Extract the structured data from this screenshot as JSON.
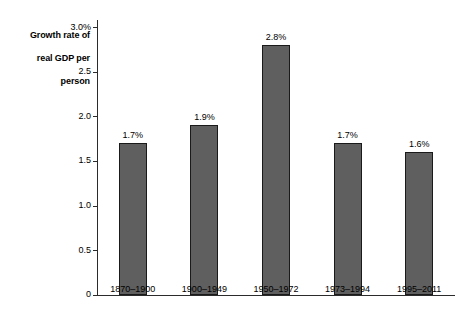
{
  "chart_data": {
    "type": "bar",
    "title": "Growth rate of real GDP per person",
    "xlabel": "",
    "ylabel": "Growth rate of real GDP per person",
    "categories": [
      "1870–1900",
      "1900–1949",
      "1950–1972",
      "1973–1994",
      "1995–2011"
    ],
    "values": [
      1.7,
      1.9,
      2.8,
      1.7,
      1.6
    ],
    "value_labels": [
      "1.7%",
      "1.9%",
      "2.8%",
      "1.7%",
      "1.6%"
    ],
    "ylim": [
      0,
      3.0
    ],
    "y_ticks": [
      0,
      0.5,
      1.0,
      1.5,
      2.0,
      2.5,
      3.0
    ],
    "y_tick_labels": [
      "0",
      "0.5",
      "1.0",
      "1.5",
      "2.0",
      "2.5",
      "3.0%"
    ],
    "grid": false,
    "legend": null,
    "bar_color": "#5f5f5f",
    "bar_edge_color": "#1a1a1a",
    "axis_color": "#2b2b2b",
    "background": "#ffffff"
  },
  "axis": {
    "title_line_1": "Growth rate of",
    "title_line_2": "real GDP per",
    "title_line_3": "person"
  }
}
